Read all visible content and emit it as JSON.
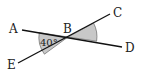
{
  "diagram": {
    "type": "intersecting-lines",
    "points": {
      "A": {
        "label": "A",
        "x": 22,
        "y": 30,
        "label_x": 9,
        "label_y": 33
      },
      "B": {
        "label": "B",
        "x": 68,
        "y": 37,
        "label_x": 63,
        "label_y": 33
      },
      "C": {
        "label": "C",
        "x": 110,
        "y": 14,
        "label_x": 113,
        "label_y": 17
      },
      "D": {
        "label": "D",
        "x": 122,
        "y": 47,
        "label_x": 125,
        "label_y": 52
      },
      "E": {
        "label": "E",
        "x": 18,
        "y": 63,
        "label_x": 7,
        "label_y": 69
      }
    },
    "lines": [
      {
        "name": "line-AD",
        "from": "A",
        "to": "D"
      },
      {
        "name": "line-EC",
        "from": "E",
        "to": "C"
      }
    ],
    "angles": [
      {
        "name": "angle-ABE",
        "vertex": "B",
        "between": [
          "A",
          "E"
        ],
        "label": "40°",
        "shaded": true
      },
      {
        "name": "angle-CBD",
        "vertex": "B",
        "between": [
          "C",
          "D"
        ],
        "label": "",
        "shaded": true
      }
    ],
    "angle_label": "40°",
    "colors": {
      "line": "#111111",
      "shade": "#c8c8c8",
      "text": "#222222"
    }
  }
}
